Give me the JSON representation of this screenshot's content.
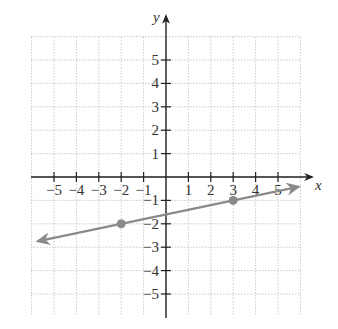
{
  "chart_data": {
    "type": "line",
    "title": "",
    "xlabel": "x",
    "ylabel": "y",
    "xlim": [
      -5.9,
      6.1
    ],
    "ylim": [
      -6.0,
      6.0
    ],
    "grid": true,
    "grid_style": "dotted",
    "x_ticks": [
      -5,
      -4,
      -3,
      -2,
      -1,
      1,
      2,
      3,
      4,
      5
    ],
    "y_ticks": [
      -5,
      -4,
      -3,
      -2,
      -1,
      1,
      2,
      3,
      4,
      5
    ],
    "x_tick_labels": [
      "−5",
      "−4",
      "−3",
      "−2",
      "−1",
      "1",
      "2",
      "3",
      "4",
      "5"
    ],
    "y_tick_labels": [
      "−5",
      "−4",
      "−3",
      "−2",
      "−1",
      "1",
      "2",
      "3",
      "4",
      "5"
    ],
    "series": [
      {
        "name": "line",
        "kind": "line",
        "equation": "y = (1/5)x - 8/5",
        "slope": 0.2,
        "intercept": -1.6,
        "x": [
          -5.7,
          5.9
        ],
        "y": [
          -2.74,
          -0.42
        ],
        "arrows": "both",
        "color": "#8a8a8a"
      },
      {
        "name": "points",
        "kind": "scatter",
        "x": [
          -2,
          3
        ],
        "y": [
          -2,
          -1
        ],
        "color": "#8a8a8a"
      }
    ]
  },
  "colors": {
    "axis": "#222222",
    "grid": "#bdbdbd",
    "line": "#8a8a8a"
  }
}
